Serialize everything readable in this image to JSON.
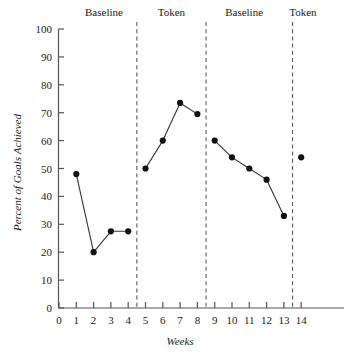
{
  "chart_data": {
    "type": "line",
    "title": "",
    "xlabel": "Weeks",
    "ylabel": "Percent of Goals Achieved",
    "xlim": [
      0,
      14.6
    ],
    "ylim": [
      0,
      100
    ],
    "grid": false,
    "legend": "none",
    "x": [
      1,
      2,
      3,
      4,
      5,
      6,
      7,
      8,
      9,
      10,
      11,
      12,
      13,
      14
    ],
    "values": [
      48,
      20,
      27.5,
      27.5,
      50,
      60,
      73.5,
      69.5,
      60,
      54,
      50,
      46,
      33,
      54
    ],
    "xticks": [
      0,
      1,
      2,
      3,
      4,
      5,
      6,
      7,
      8,
      9,
      10,
      11,
      12,
      13,
      14
    ],
    "xtick_labels": [
      "0",
      "1",
      "2",
      "3",
      "4",
      "5",
      "6",
      "7",
      "8",
      "9",
      "10",
      "11",
      "12",
      "13",
      "14"
    ],
    "yticks": [
      0,
      10,
      20,
      30,
      40,
      50,
      60,
      70,
      80,
      90,
      100
    ],
    "ytick_labels": [
      "0",
      "10",
      "20",
      "30",
      "40",
      "50",
      "60",
      "70",
      "80",
      "90",
      "100"
    ],
    "phase_dividers": [
      4.5,
      8.5,
      13.5
    ],
    "phases": [
      {
        "label": "Baseline",
        "start": 1,
        "end": 4,
        "center": 2.6
      },
      {
        "label": "Token",
        "start": 5,
        "end": 8,
        "center": 6.5
      },
      {
        "label": "Baseline",
        "start": 9,
        "end": 13,
        "center": 10.7
      },
      {
        "label": "Token",
        "start": 14,
        "end": 14,
        "center": 14.1
      }
    ],
    "series_breaks": [
      4.5,
      8.5,
      13.5
    ],
    "marker": "filled-circle",
    "marker_color": "#111111",
    "line_color": "#333333"
  }
}
